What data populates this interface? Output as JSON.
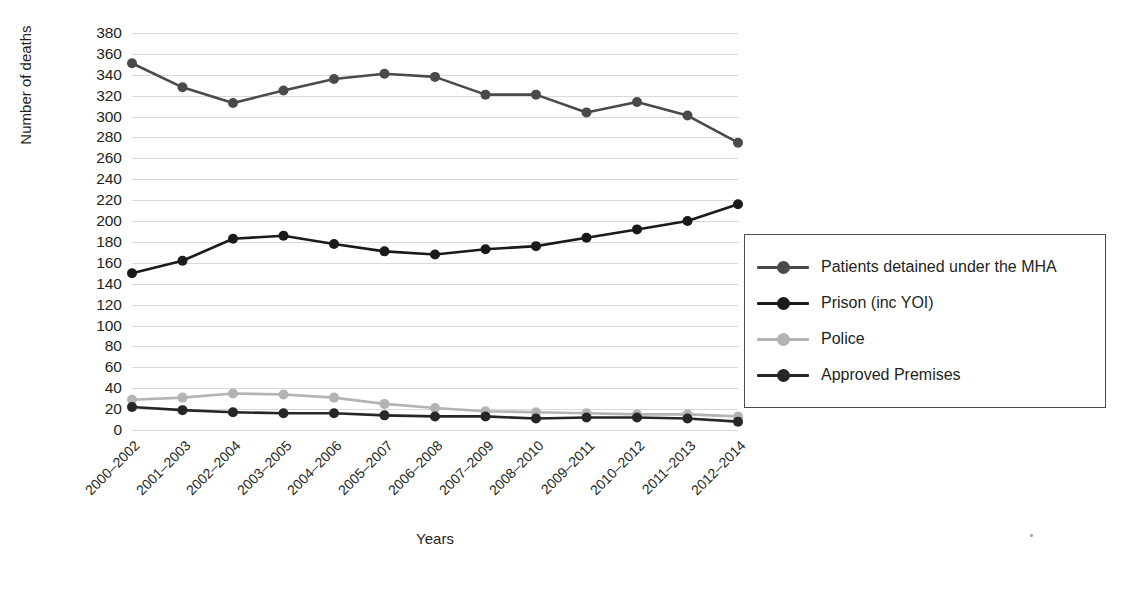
{
  "chart_data": {
    "type": "line",
    "title": "",
    "xlabel": "Years",
    "ylabel": "Number of deaths",
    "ylim": [
      0,
      380
    ],
    "ytick_step": 20,
    "yticks": [
      0,
      20,
      40,
      60,
      80,
      100,
      120,
      140,
      160,
      180,
      200,
      220,
      240,
      260,
      280,
      300,
      320,
      340,
      360,
      380
    ],
    "grid": true,
    "legend_position": "right",
    "categories": [
      "2000–2002",
      "2001–2003",
      "2002–2004",
      "2003–2005",
      "2004–2006",
      "2005–2007",
      "2006–2008",
      "2007–2009",
      "2008–2010",
      "2009–2011",
      "2010–2012",
      "2011–2013",
      "2012–2014"
    ],
    "series": [
      {
        "name": "Patients detained under the MHA",
        "color": "#4a4a4a",
        "values": [
          351,
          328,
          313,
          325,
          336,
          341,
          338,
          321,
          321,
          304,
          314,
          301,
          275
        ]
      },
      {
        "name": "Prison (inc YOI)",
        "color": "#1a1a1a",
        "values": [
          150,
          162,
          183,
          186,
          178,
          171,
          168,
          173,
          176,
          184,
          192,
          200,
          216
        ]
      },
      {
        "name": "Police",
        "color": "#b3b3b3",
        "values": [
          29,
          31,
          35,
          34,
          31,
          25,
          21,
          18,
          17,
          16,
          15,
          15,
          13
        ]
      },
      {
        "name": "Approved Premises",
        "color": "#262626",
        "values": [
          22,
          19,
          17,
          16,
          16,
          14,
          13,
          13,
          11,
          12,
          12,
          11,
          8
        ]
      }
    ]
  },
  "legend": {
    "items": [
      {
        "label": "Patients detained under the MHA",
        "color": "#4a4a4a"
      },
      {
        "label": "Prison (inc YOI)",
        "color": "#1a1a1a"
      },
      {
        "label": "Police",
        "color": "#b3b3b3"
      },
      {
        "label": "Approved Premises",
        "color": "#262626"
      }
    ]
  },
  "colors": {
    "gridline": "#d9d9d9",
    "text": "#231f20",
    "background": "#ffffff",
    "legend_border": "#4d4d4d"
  }
}
